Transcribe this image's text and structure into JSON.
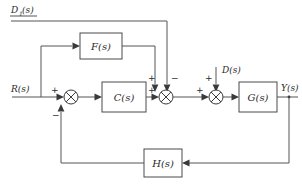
{
  "diagram": {
    "type": "block-diagram",
    "blocks": [
      {
        "id": "F",
        "label": "F(s)",
        "role": "feedforward-compensator"
      },
      {
        "id": "C",
        "label": "C(s)",
        "role": "controller"
      },
      {
        "id": "G",
        "label": "G(s)",
        "role": "plant"
      },
      {
        "id": "H",
        "label": "H(s)",
        "role": "feedback-sensor"
      }
    ],
    "signals": {
      "disturbance_top_base": "D",
      "disturbance_top_sub": "1",
      "disturbance_top_tail": "(s)",
      "reference": "R(s)",
      "disturbance_mid": "D(s)",
      "output": "Y(s)"
    },
    "signs": {
      "sum1_reference": "+",
      "sum1_feedback": "−",
      "sum2_forward": "+",
      "sum2_feedforward": "+",
      "sum2_disturbance_top": "−",
      "sum3_forward": "+",
      "sum3_disturbance": "+"
    },
    "colors": {
      "background": "#ffffff",
      "wire": "#555555",
      "block_stroke": "#4a4a4a",
      "text": "#2b2b2b"
    }
  }
}
